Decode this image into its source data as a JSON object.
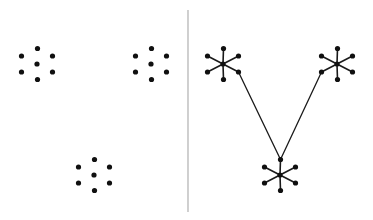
{
  "figure": {
    "width": 373,
    "height": 220,
    "background_color": "#ffffff",
    "type": "diagram"
  },
  "style": {
    "dot_color": "#101010",
    "edge_color": "#1a1a1a",
    "divider_color": "#b0b0b0",
    "dot_radius": 2.6,
    "spoke_stroke_width": 1.6,
    "link_stroke_width": 1.3,
    "divider_stroke_width": 1.2
  },
  "divider": {
    "name": "panel-divider",
    "x": 188,
    "y_top": 10,
    "y_bottom": 212
  },
  "cluster_template": {
    "description": "Seven points: one center plus six arranged around it.",
    "point_count": 7,
    "offsets": [
      {
        "role": "center",
        "dx": 0.0,
        "dy": 0.0
      },
      {
        "role": "top",
        "dx": 0.5,
        "dy": -15.5
      },
      {
        "role": "upper-right",
        "dx": 15.5,
        "dy": -8.0
      },
      {
        "role": "lower-right",
        "dx": 15.5,
        "dy": 8.0
      },
      {
        "role": "bottom",
        "dx": 0.5,
        "dy": 15.5
      },
      {
        "role": "lower-left",
        "dx": -15.5,
        "dy": 8.0
      },
      {
        "role": "upper-left",
        "dx": -15.5,
        "dy": -8.0
      }
    ]
  },
  "left_panel": {
    "name": "points-only-panel",
    "label": "Point set without edges",
    "draw_edges": false,
    "clusters": [
      {
        "id": "left-upper-left-cluster",
        "cx": 37,
        "cy": 64
      },
      {
        "id": "left-upper-right-cluster",
        "cx": 151,
        "cy": 64
      },
      {
        "id": "left-bottom-cluster",
        "cx": 94,
        "cy": 175
      }
    ]
  },
  "right_panel": {
    "name": "graph-panel",
    "label": "Same point set with star edges and cluster links",
    "draw_edges": true,
    "clusters": [
      {
        "id": "right-upper-left-cluster",
        "cx": 223,
        "cy": 64
      },
      {
        "id": "right-upper-right-cluster",
        "cx": 337,
        "cy": 64
      },
      {
        "id": "right-bottom-cluster",
        "cx": 280,
        "cy": 175
      }
    ],
    "inter_cluster_links": [
      {
        "id": "link-upper-left-to-bottom",
        "from_cluster": "right-upper-left-cluster",
        "from_role": "lower-right",
        "to_cluster": "right-bottom-cluster",
        "to_role": "top"
      },
      {
        "id": "link-upper-right-to-bottom",
        "from_cluster": "right-upper-right-cluster",
        "from_role": "lower-left",
        "to_cluster": "right-bottom-cluster",
        "to_role": "top"
      }
    ]
  }
}
